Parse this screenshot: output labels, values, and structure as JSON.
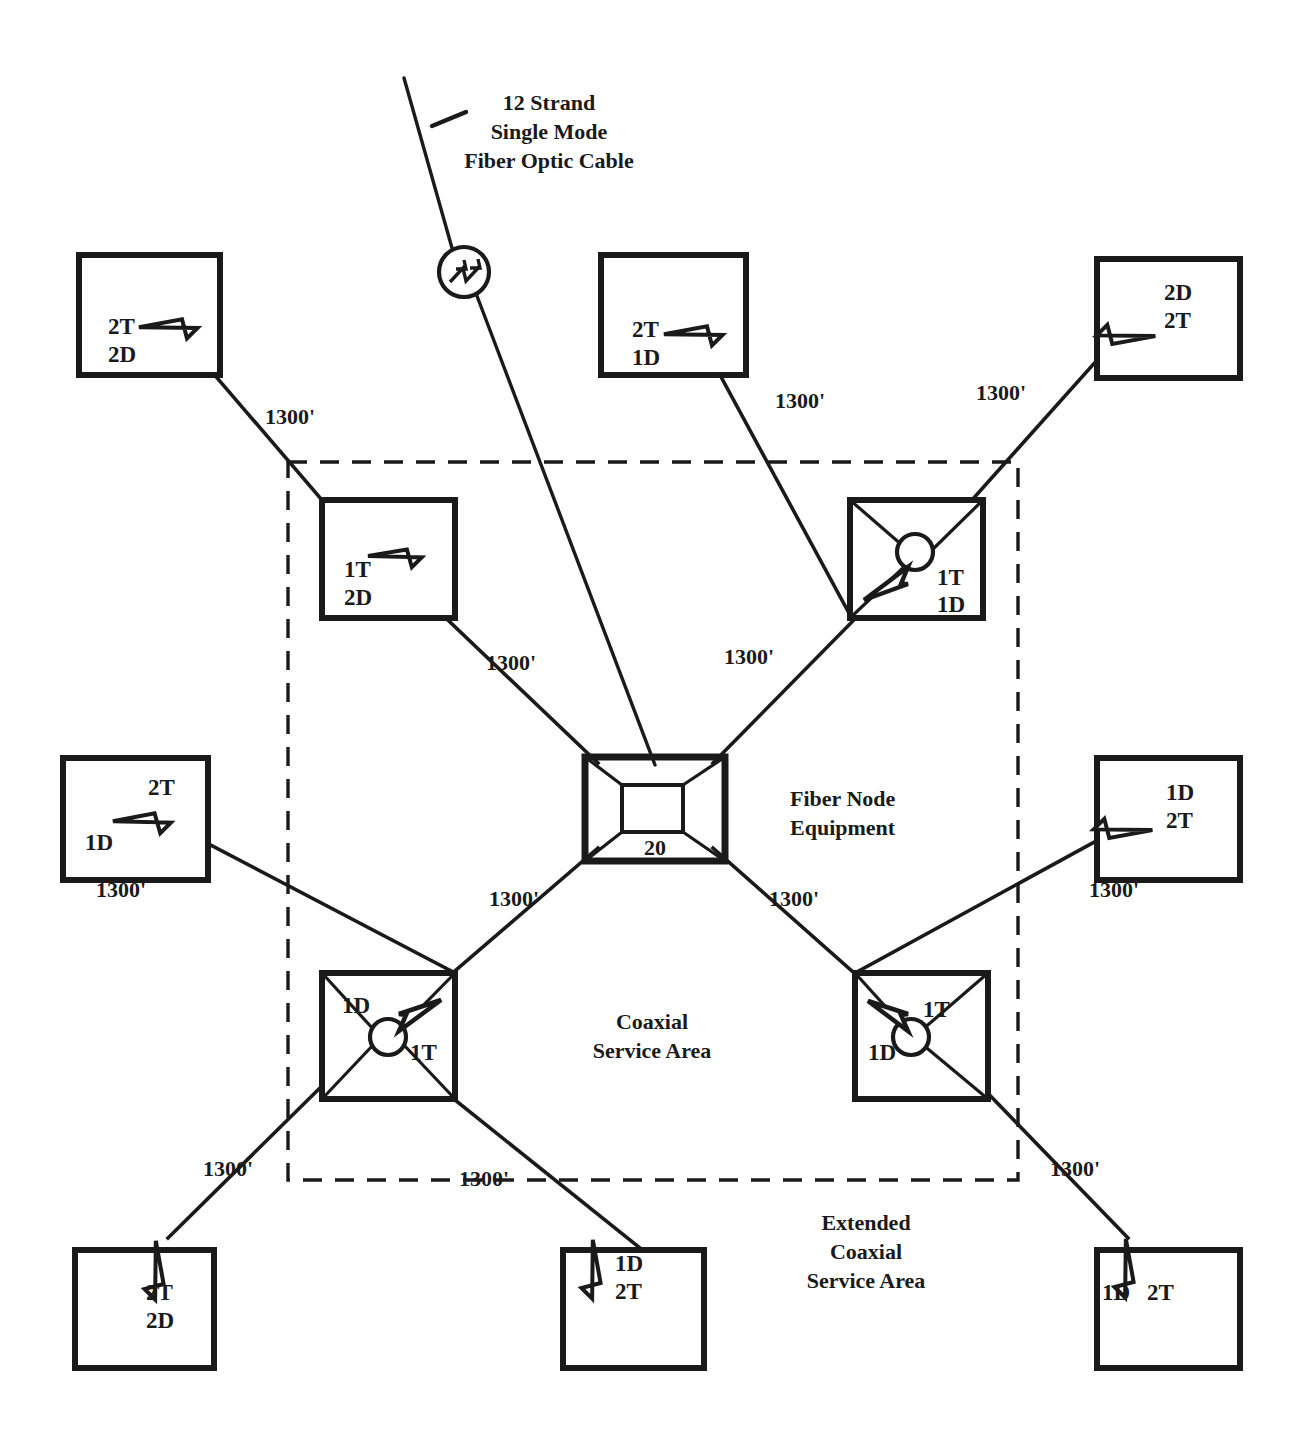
{
  "diagram": {
    "fiber_cable_label": {
      "line1": "12 Strand",
      "line2": "Single Mode",
      "line3": "Fiber Optic Cable"
    },
    "fiber_node": {
      "equipment_label_line1": "Fiber Node",
      "equipment_label_line2": "Equipment",
      "number": "20",
      "icon": "fiber-node-icon"
    },
    "optical_device": {
      "icon": "optical-receiver-icon"
    },
    "service_areas": [
      {
        "id": "coaxial-service-area",
        "line1": "Coaxial",
        "line2": "Service Area"
      },
      {
        "id": "extended-coaxial-service-area",
        "line1": "Extended",
        "line2": "Coaxial",
        "line3": "Service Area"
      }
    ],
    "distance_labels": [
      {
        "id": "dist-nw-outer",
        "value": "1300'"
      },
      {
        "id": "dist-n-outer",
        "value": "1300'"
      },
      {
        "id": "dist-ne-outer",
        "value": "1300'"
      },
      {
        "id": "dist-nw-inner",
        "value": "1300'"
      },
      {
        "id": "dist-ne-inner",
        "value": "1300'"
      },
      {
        "id": "dist-w-outer",
        "value": "1300'"
      },
      {
        "id": "dist-e-outer",
        "value": "1300'"
      },
      {
        "id": "dist-sw-inner",
        "value": "1300'"
      },
      {
        "id": "dist-se-inner",
        "value": "1300'"
      },
      {
        "id": "dist-sw-outer",
        "value": "1300'"
      },
      {
        "id": "dist-s-outer",
        "value": "1300'"
      },
      {
        "id": "dist-se-outer",
        "value": "1300'"
      }
    ],
    "amplifier_boxes": [
      {
        "id": "amp-top-left",
        "label_a": "2T",
        "label_b": "2D",
        "type": "plain-amplifier"
      },
      {
        "id": "amp-top-middle",
        "label_a": "2T",
        "label_b": "1D",
        "type": "plain-amplifier"
      },
      {
        "id": "amp-top-right",
        "label_a": "2D",
        "label_b": "2T",
        "type": "plain-amplifier"
      },
      {
        "id": "amp-inner-upper-left",
        "label_a": "1T",
        "label_b": "2D",
        "type": "plain-amplifier"
      },
      {
        "id": "amp-inner-upper-right",
        "label_a": "1T",
        "label_b": "1D",
        "type": "splitter-amplifier"
      },
      {
        "id": "amp-middle-left",
        "label_a": "2T",
        "label_b": "1D",
        "type": "plain-amplifier"
      },
      {
        "id": "amp-middle-right",
        "label_a": "1D",
        "label_b": "2T",
        "type": "plain-amplifier"
      },
      {
        "id": "amp-inner-lower-left",
        "label_a": "1D",
        "label_b": "1T",
        "type": "splitter-amplifier"
      },
      {
        "id": "amp-inner-lower-right",
        "label_a": "1T",
        "label_b": "1D",
        "type": "splitter-amplifier"
      },
      {
        "id": "amp-bottom-left",
        "label_a": "2T",
        "label_b": "2D",
        "type": "plain-amplifier"
      },
      {
        "id": "amp-bottom-middle",
        "label_a": "1D",
        "label_b": "2T",
        "type": "plain-amplifier"
      },
      {
        "id": "amp-bottom-right",
        "label_a": "1D",
        "label_b": "2T",
        "type": "plain-amplifier"
      }
    ],
    "colors": {
      "ink": "#1a1a1a",
      "paper": "#ffffff"
    }
  }
}
